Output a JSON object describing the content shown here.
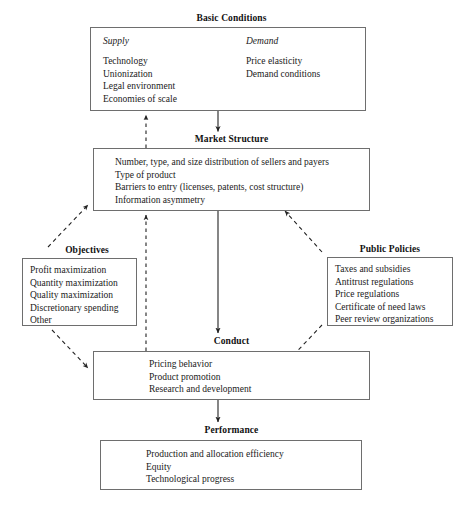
{
  "diagram": {
    "line_color": "#6e6e6e",
    "text_color": "#1a1a1a",
    "arrow_color": "#222222"
  },
  "basic_conditions": {
    "title": "Basic Conditions",
    "supply": {
      "heading": "Supply",
      "items": [
        "Technology",
        "Unionization",
        "Legal environment",
        "Economies of scale"
      ]
    },
    "demand": {
      "heading": "Demand",
      "items": [
        "Price elasticity",
        "Demand conditions"
      ]
    }
  },
  "market_structure": {
    "title": "Market Structure",
    "items": [
      "Number, type, and size distribution of sellers and payers",
      "Type of product",
      "Barriers to entry (licenses, patents, cost structure)",
      "Information asymmetry"
    ]
  },
  "objectives": {
    "title": "Objectives",
    "items": [
      "Profit maximization",
      "Quantity maximization",
      "Quality maximization",
      "Discretionary spending",
      "Other"
    ]
  },
  "public_policies": {
    "title": "Public Policies",
    "items": [
      "Taxes and subsidies",
      "Antitrust regulations",
      "Price regulations",
      "Certificate of need laws",
      "Peer review organizations"
    ]
  },
  "conduct": {
    "title": "Conduct",
    "items": [
      "Pricing behavior",
      "Product promotion",
      "Research and development"
    ]
  },
  "performance": {
    "title": "Performance",
    "items": [
      "Production and allocation efficiency",
      "Equity",
      "Technological progress"
    ]
  },
  "connectors": [
    {
      "name": "basic-conditions-to-market-structure",
      "style": "solid",
      "from": "basic_conditions",
      "to": "market_structure"
    },
    {
      "name": "market-structure-to-conduct",
      "style": "solid",
      "from": "market_structure",
      "to": "conduct"
    },
    {
      "name": "conduct-to-performance",
      "style": "solid",
      "from": "conduct",
      "to": "performance"
    },
    {
      "name": "conduct-to-market-structure-feedback",
      "style": "dashed",
      "from": "conduct",
      "to": "market_structure"
    },
    {
      "name": "market-structure-to-basic-conditions-feedback",
      "style": "dashed",
      "from": "market_structure",
      "to": "basic_conditions"
    },
    {
      "name": "objectives-to-market-structure",
      "style": "dashed",
      "from": "objectives",
      "to": "market_structure"
    },
    {
      "name": "objectives-to-conduct",
      "style": "dashed",
      "from": "objectives",
      "to": "conduct"
    },
    {
      "name": "public-policies-to-market-structure",
      "style": "dashed",
      "from": "public_policies",
      "to": "market_structure"
    },
    {
      "name": "public-policies-to-conduct",
      "style": "dashed",
      "from": "public_policies",
      "to": "conduct"
    }
  ]
}
